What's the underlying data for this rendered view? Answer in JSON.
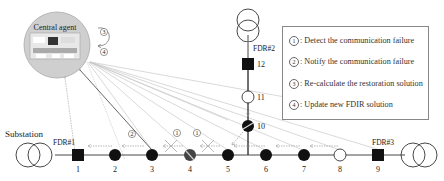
{
  "central_agent": {
    "label": "Central agent"
  },
  "labels": {
    "substation": "Substation",
    "fdr1": "FDR#1",
    "fdr2": "FDR#2",
    "fdr3": "FDR#3"
  },
  "steps_near_agent": [
    "③",
    "④"
  ],
  "step_markers": [
    "②",
    "①",
    "①"
  ],
  "nodes": [
    {
      "id": "1",
      "type": "breaker-closed"
    },
    {
      "id": "2",
      "type": "switch-closed"
    },
    {
      "id": "3",
      "type": "switch-closed"
    },
    {
      "id": "4",
      "type": "switch-faulted"
    },
    {
      "id": "5",
      "type": "switch-closed"
    },
    {
      "id": "6",
      "type": "switch-closed"
    },
    {
      "id": "7",
      "type": "switch-closed"
    },
    {
      "id": "8",
      "type": "switch-open"
    },
    {
      "id": "9",
      "type": "breaker-closed"
    },
    {
      "id": "10",
      "type": "switch-faulted"
    },
    {
      "id": "11",
      "type": "switch-open"
    },
    {
      "id": "12",
      "type": "breaker-closed"
    }
  ],
  "legend": {
    "items": [
      {
        "num": "1",
        "text": ": Detect the communication failure"
      },
      {
        "num": "2",
        "text": ": Notify the communication failure"
      },
      {
        "num": "3",
        "text": ": Re-calculate the restoration solution"
      },
      {
        "num": "4",
        "text": ": Update new FDIR solution"
      }
    ]
  }
}
